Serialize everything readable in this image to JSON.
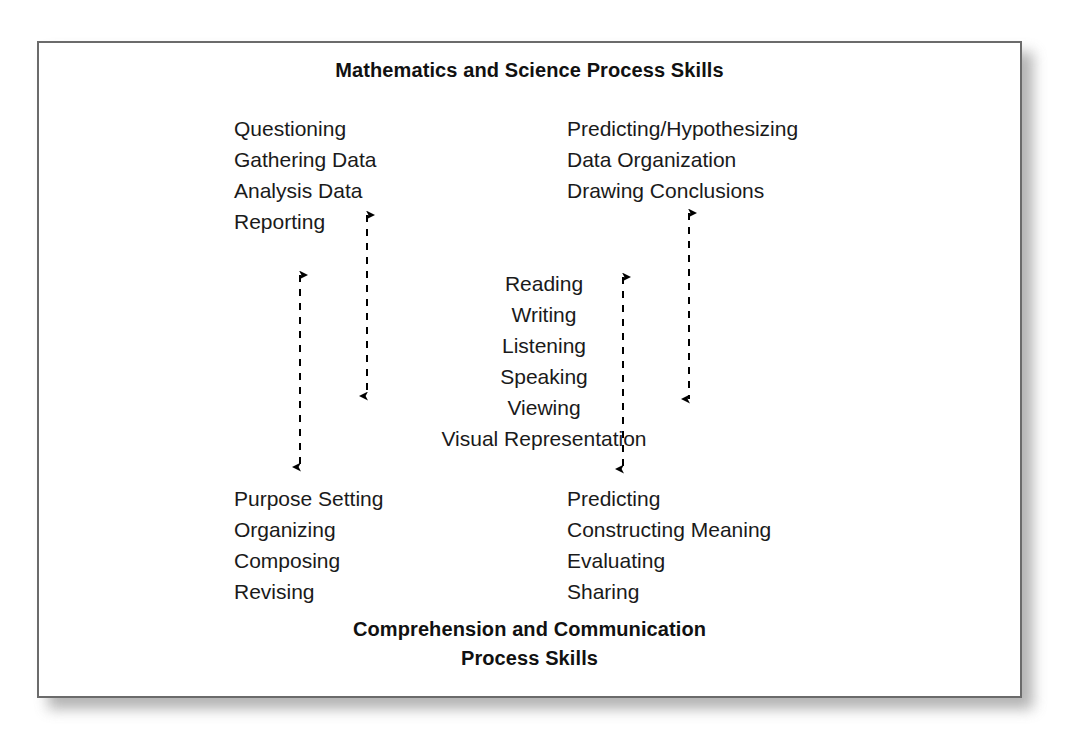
{
  "diagram": {
    "title_top": "Mathematics and Science Process Skills",
    "title_bottom_line1": "Comprehension and Communication",
    "title_bottom_line2": "Process Skills",
    "border_color": "#6b6b6b",
    "text_color": "#1a1a1a",
    "arrow_color": "#000000",
    "background_color": "#ffffff"
  },
  "math_skills": {
    "item0": "Questioning",
    "item1": "Gathering Data",
    "item2": "Analysis Data",
    "item3": "Reporting"
  },
  "science_skills": {
    "item0": "Predicting/Hypothesizing",
    "item1": "Data Organization",
    "item2": "Drawing Conclusions"
  },
  "language_skills": {
    "item0": "Reading",
    "item1": "Writing",
    "item2": "Listening",
    "item3": "Speaking",
    "item4": "Viewing",
    "item5": "Visual Representation"
  },
  "comprehension_skills": {
    "item0": "Purpose Setting",
    "item1": "Organizing",
    "item2": "Composing",
    "item3": "Revising"
  },
  "communication_skills": {
    "item0": "Predicting",
    "item1": "Constructing Meaning",
    "item2": "Evaluating",
    "item3": "Sharing"
  },
  "connectors": {
    "arrow_left_inner_name": "reporting-to-visual-representation",
    "arrow_left_outer_name": "math-to-comprehension",
    "arrow_right_inner_name": "language-to-communication",
    "arrow_right_outer_name": "science-to-communication",
    "style": "dashed double-headed vertical"
  }
}
